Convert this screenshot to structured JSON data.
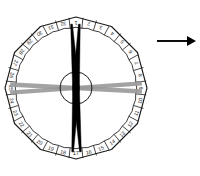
{
  "figure": {
    "background_color": "#ffffff",
    "outline_color": "#1a1a1a",
    "numeral_color": "#1a1a1a",
    "pointer_color": "#000000",
    "band_color": "#9a9a9a"
  },
  "dial": {
    "center_x": 76,
    "center_y": 88,
    "outer_radius": 71,
    "inner_radius": 60,
    "hub_radius": 16,
    "sides": 12,
    "division_count": 32,
    "numerals": [
      "1",
      "2",
      "3",
      "4",
      "5",
      "6",
      "7",
      "8",
      "9",
      "10",
      "11",
      "12",
      "13",
      "14",
      "15",
      "16",
      "17",
      "18",
      "19",
      "20",
      "21",
      "22",
      "23",
      "24",
      "25",
      "26",
      "27",
      "28",
      "29",
      "30",
      "31",
      "32"
    ],
    "numeral_start": "1",
    "numeral_direction": "clockwise"
  },
  "pointers": [
    {
      "name": "pointer-a",
      "angle_deg": 3,
      "label": ""
    },
    {
      "name": "pointer-b",
      "angle_deg": -4,
      "label": ""
    }
  ],
  "bands": [
    {
      "name": "band-a",
      "angle_deg": 93,
      "label": ""
    },
    {
      "name": "band-b",
      "angle_deg": 86,
      "label": ""
    }
  ],
  "arrow": {
    "label": "",
    "x1": 157,
    "y1": 41,
    "x2": 196,
    "y2": 41,
    "direction": "right",
    "color": "#000000"
  }
}
